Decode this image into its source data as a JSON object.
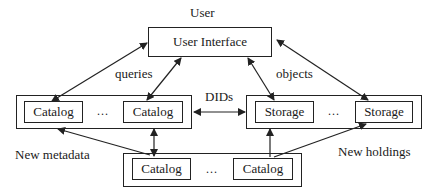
{
  "diagram": {
    "user_label": "User",
    "user_interface": "User Interface",
    "edge_labels": {
      "queries": "queries",
      "objects": "objects",
      "dids": "DIDs",
      "new_metadata": "New metadata",
      "new_holdings": "New holdings"
    },
    "catalog_group": {
      "items": [
        "Catalog",
        "Catalog"
      ],
      "ellipsis": "..."
    },
    "storage_group": {
      "items": [
        "Storage",
        "Storage"
      ],
      "ellipsis": "..."
    },
    "bottom_catalog_group": {
      "items": [
        "Catalog",
        "Catalog"
      ],
      "ellipsis": "..."
    },
    "colors": {
      "line": "#222222",
      "background": "#ffffff"
    }
  }
}
